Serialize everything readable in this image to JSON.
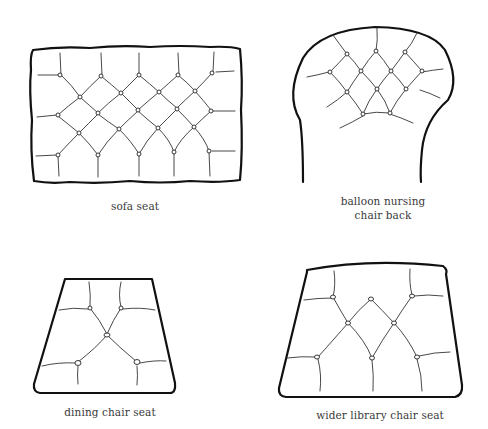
{
  "figure": {
    "panels": [
      {
        "id": "sofa-seat",
        "label": "sofa seat"
      },
      {
        "id": "balloon-nursing-chair-back",
        "label_line1": "balloon nursing",
        "label_line2": "chair back"
      },
      {
        "id": "dining-chair-seat",
        "label": "dining chair seat"
      },
      {
        "id": "wider-library-chair-seat",
        "label": "wider library chair seat"
      }
    ]
  },
  "colors": {
    "outline": "#111111",
    "tuft_lines": "#333333",
    "background": "#ffffff",
    "label_text": "#3a3a3a"
  }
}
